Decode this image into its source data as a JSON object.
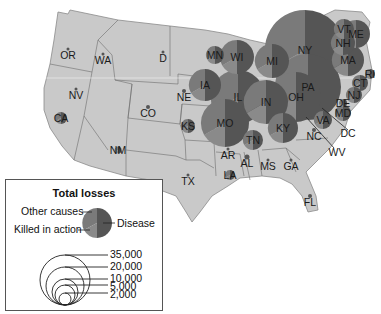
{
  "chart_data": {
    "type": "proportional-symbol-map",
    "title": "Total losses",
    "legend": {
      "pie_segments": [
        "Other causes",
        "Killed in action",
        "Disease"
      ],
      "size_scale": [
        "35,000",
        "20,000",
        "10,000",
        "5,000",
        "2,000"
      ]
    },
    "colors": {
      "land": "#c9c9c9",
      "border": "#6d6d6d",
      "disease": "#555555",
      "killed_in_action": "#8a8a8a",
      "other_causes": "#7a7a7a"
    },
    "states": [
      {
        "abbr": "OR",
        "x": 68,
        "y": 55,
        "r": 1.5
      },
      {
        "abbr": "WA",
        "x": 103,
        "y": 60,
        "r": 1.5
      },
      {
        "abbr": "D",
        "x": 163,
        "y": 58,
        "r": 1.5
      },
      {
        "abbr": "NV",
        "x": 76,
        "y": 95,
        "r": 1.5
      },
      {
        "abbr": "CA",
        "x": 61,
        "y": 118,
        "r": 6
      },
      {
        "abbr": "CO",
        "x": 148,
        "y": 113,
        "r": 2
      },
      {
        "abbr": "NE",
        "x": 184,
        "y": 97,
        "r": 2
      },
      {
        "abbr": "KS",
        "x": 188,
        "y": 126,
        "r": 7
      },
      {
        "abbr": "NM",
        "x": 118,
        "y": 150,
        "r": 3.5
      },
      {
        "abbr": "TX",
        "x": 188,
        "y": 181,
        "r": 1.5
      },
      {
        "abbr": "MN",
        "x": 215,
        "y": 55,
        "r": 9
      },
      {
        "abbr": "WI",
        "x": 237,
        "y": 57,
        "r": 17
      },
      {
        "abbr": "MI",
        "x": 272,
        "y": 61,
        "r": 17
      },
      {
        "abbr": "IA",
        "x": 205,
        "y": 85,
        "r": 16
      },
      {
        "abbr": "IL",
        "x": 238,
        "y": 97,
        "r": 27
      },
      {
        "abbr": "IN",
        "x": 266,
        "y": 102,
        "r": 22
      },
      {
        "abbr": "OH",
        "x": 296,
        "y": 97,
        "r": 25
      },
      {
        "abbr": "MO",
        "x": 225,
        "y": 123,
        "r": 24
      },
      {
        "abbr": "KY",
        "x": 283,
        "y": 128,
        "r": 15
      },
      {
        "abbr": "TN",
        "x": 253,
        "y": 140,
        "r": 10
      },
      {
        "abbr": "AR",
        "x": 228,
        "y": 155,
        "r": 1.5
      },
      {
        "abbr": "LA",
        "x": 230,
        "y": 175,
        "r": 5
      },
      {
        "abbr": "AL",
        "x": 247,
        "y": 163,
        "r": 2.5
      },
      {
        "abbr": "MS",
        "x": 268,
        "y": 166,
        "r": 1.5
      },
      {
        "abbr": "GA",
        "x": 291,
        "y": 166,
        "r": 1.5
      },
      {
        "abbr": "FL",
        "x": 310,
        "y": 202,
        "r": 2
      },
      {
        "abbr": "PA",
        "x": 308,
        "y": 87,
        "r": 33
      },
      {
        "abbr": "NY",
        "x": 305,
        "y": 50,
        "r": 40
      },
      {
        "abbr": "VT",
        "x": 344,
        "y": 29,
        "r": 10
      },
      {
        "abbr": "NH",
        "x": 343,
        "y": 43,
        "r": 12
      },
      {
        "abbr": "ME",
        "x": 356,
        "y": 34,
        "r": 14
      },
      {
        "abbr": "MA",
        "x": 348,
        "y": 60,
        "r": 16
      },
      {
        "abbr": "RI",
        "x": 370,
        "y": 74,
        "r": 5
      },
      {
        "abbr": "CT",
        "x": 360,
        "y": 83,
        "r": 8
      },
      {
        "abbr": "NJ",
        "x": 354,
        "y": 95,
        "r": 8
      },
      {
        "abbr": "DE",
        "x": 343,
        "y": 103,
        "r": 4
      },
      {
        "abbr": "MD",
        "x": 343,
        "y": 113,
        "r": 8
      },
      {
        "abbr": "VA",
        "x": 323,
        "y": 120,
        "r": 9
      },
      {
        "abbr": "NC",
        "x": 314,
        "y": 136,
        "r": 2
      },
      {
        "abbr": "DC",
        "x": 348,
        "y": 133,
        "r": 0
      },
      {
        "abbr": "WV",
        "x": 337,
        "y": 152,
        "r": 0
      }
    ]
  },
  "legend": {
    "title": "Total losses",
    "other_causes": "Other causes",
    "killed_in_action": "Killed in action",
    "disease": "Disease",
    "scale": [
      "35,000",
      "20,000",
      "10,000",
      "5,000",
      "2,000"
    ]
  },
  "labels": {
    "OR": "OR",
    "WA": "WA",
    "D": "D",
    "NV": "NV",
    "CA": "CA",
    "CO": "CO",
    "NE": "NE",
    "KS": "KS",
    "NM": "NM",
    "TX": "TX",
    "MN": "MN",
    "WI": "WI",
    "MI": "MI",
    "IA": "IA",
    "IL": "IL",
    "IN": "IN",
    "OH": "OH",
    "MO": "MO",
    "KY": "KY",
    "TN": "TN",
    "AR": "AR",
    "LA": "LA",
    "AL": "AL",
    "MS": "MS",
    "GA": "GA",
    "FL": "FL",
    "PA": "PA",
    "NY": "NY",
    "VT": "VT",
    "NH": "NH",
    "ME": "ME",
    "MA": "MA",
    "RI": "RI",
    "CT": "CT",
    "NJ": "NJ",
    "DE": "DE",
    "MD": "MD",
    "VA": "VA",
    "NC": "NC",
    "DC": "DC",
    "WV": "WV"
  }
}
